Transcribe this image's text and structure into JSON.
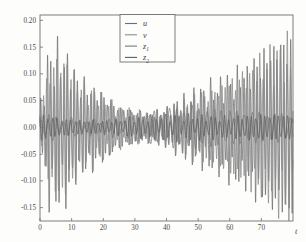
{
  "figure": {
    "background_color": "#fdfdfc",
    "frame_color": "#6f6f6f",
    "x_axis_label": "t"
  },
  "chart_data": {
    "type": "line",
    "title": "",
    "subtitle": "",
    "xlabel": "t",
    "ylabel": "",
    "grid": false,
    "legend_position": "top-center",
    "xlim": [
      0,
      80
    ],
    "ylim": [
      -0.175,
      0.21
    ],
    "x_ticks": [
      0,
      10,
      20,
      30,
      40,
      50,
      60,
      70
    ],
    "x_tick_labels": [
      "0",
      "10",
      "20",
      "30",
      "40",
      "50",
      "60",
      "70"
    ],
    "y_ticks": [
      -0.15,
      -0.1,
      -0.05,
      0.0,
      0.05,
      0.1,
      0.15,
      0.2
    ],
    "y_tick_labels": [
      "-0.15",
      "-0.10",
      "-0.05",
      "0.00",
      "0.05",
      "0.10",
      "0.15",
      "0.20"
    ],
    "series": [
      {
        "name": "u",
        "label": "u",
        "label_base": "u",
        "label_sub": "",
        "color": "#6e6e6e",
        "description": "high-amplitude oscillation, large at start, quiet mid, growing at end",
        "envelope": [
          [
            0,
            0.05
          ],
          [
            3,
            0.15
          ],
          [
            6,
            0.16
          ],
          [
            9,
            0.14
          ],
          [
            12,
            0.105
          ],
          [
            16,
            0.085
          ],
          [
            20,
            0.07
          ],
          [
            25,
            0.045
          ],
          [
            30,
            0.035
          ],
          [
            35,
            0.03
          ],
          [
            40,
            0.04
          ],
          [
            45,
            0.06
          ],
          [
            50,
            0.075
          ],
          [
            55,
            0.085
          ],
          [
            60,
            0.105
          ],
          [
            65,
            0.12
          ],
          [
            70,
            0.15
          ],
          [
            75,
            0.175
          ],
          [
            80,
            0.19
          ]
        ],
        "frequency": 0.95,
        "phase": 0.0
      },
      {
        "name": "v",
        "label": "v",
        "label_base": "v",
        "label_sub": "",
        "color": "#8a8a8a",
        "description": "second high-amplitude oscillation, phase-shifted from u",
        "envelope": [
          [
            0,
            0.045
          ],
          [
            3,
            0.12
          ],
          [
            6,
            0.155
          ],
          [
            9,
            0.135
          ],
          [
            12,
            0.1
          ],
          [
            16,
            0.08
          ],
          [
            20,
            0.065
          ],
          [
            25,
            0.04
          ],
          [
            30,
            0.032
          ],
          [
            35,
            0.028
          ],
          [
            40,
            0.038
          ],
          [
            45,
            0.055
          ],
          [
            50,
            0.07
          ],
          [
            55,
            0.08
          ],
          [
            60,
            0.1
          ],
          [
            65,
            0.115
          ],
          [
            70,
            0.14
          ],
          [
            75,
            0.165
          ],
          [
            80,
            0.18
          ]
        ],
        "frequency": 0.92,
        "phase": 1.9
      },
      {
        "name": "z1",
        "label": "z1",
        "label_base": "z",
        "label_sub": "1",
        "color": "#777777",
        "description": "low-amplitude slow modulated oscillation near zero",
        "envelope": [
          [
            0,
            0.03
          ],
          [
            5,
            0.022
          ],
          [
            10,
            0.018
          ],
          [
            15,
            0.016
          ],
          [
            20,
            0.015
          ],
          [
            25,
            0.02
          ],
          [
            30,
            0.028
          ],
          [
            35,
            0.032
          ],
          [
            40,
            0.04
          ],
          [
            45,
            0.042
          ],
          [
            50,
            0.045
          ],
          [
            55,
            0.04
          ],
          [
            60,
            0.038
          ],
          [
            65,
            0.035
          ],
          [
            70,
            0.032
          ],
          [
            75,
            0.03
          ],
          [
            80,
            0.028
          ]
        ],
        "frequency": 0.42,
        "phase": 0.6
      },
      {
        "name": "z2",
        "label": "z2",
        "label_base": "z",
        "label_sub": "2",
        "color": "#5c5c5c",
        "description": "low-amplitude fast small ripple near zero",
        "envelope": [
          [
            0,
            0.028
          ],
          [
            5,
            0.02
          ],
          [
            10,
            0.016
          ],
          [
            15,
            0.014
          ],
          [
            20,
            0.014
          ],
          [
            25,
            0.016
          ],
          [
            30,
            0.02
          ],
          [
            35,
            0.022
          ],
          [
            40,
            0.024
          ],
          [
            45,
            0.025
          ],
          [
            50,
            0.024
          ],
          [
            55,
            0.022
          ],
          [
            60,
            0.022
          ],
          [
            65,
            0.024
          ],
          [
            70,
            0.026
          ],
          [
            75,
            0.026
          ],
          [
            80,
            0.025
          ]
        ],
        "frequency": 0.7,
        "phase": 2.7
      }
    ]
  },
  "legend": {
    "entries": [
      {
        "label_base": "u",
        "label_sub": "",
        "color": "#6e6e6e"
      },
      {
        "label_base": "v",
        "label_sub": "",
        "color": "#8a8a8a"
      },
      {
        "label_base": "z",
        "label_sub": "1",
        "color": "#777777"
      },
      {
        "label_base": "z",
        "label_sub": "2",
        "color": "#5c5c5c"
      }
    ]
  }
}
